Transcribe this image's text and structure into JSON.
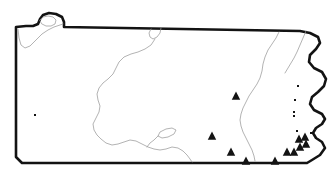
{
  "figure": {
    "kind": "outline-map",
    "width": 335,
    "height": 178,
    "background_color": "#ffffff",
    "outline_color": "#131313",
    "interior_line_color": "#9a9a9a",
    "marker_color": "#131313",
    "title": "",
    "caption": "",
    "labels": []
  },
  "geometry": {
    "state_outline_path": "M 16,27 L 16,157 L 22,163 L 307,163 L 312,160 L 320,155 L 325,148 L 322,142 L 316,138 L 313,133 L 316,128 L 322,124 L 325,119 L 322,114 L 314,110 L 310,104 L 312,97 L 318,92 L 324,86 L 326,79 L 322,72 L 314,68 L 309,62 L 310,55 L 316,49 L 320,43 L 318,37 L 310,33 L 300,31 L 64,27 L 64,22 L 62,17 L 56,14 L 49,13 L 43,15 L 40,19 L 38,24 L 33,26 L 26,26 Z",
    "erie_shoreline_path": "M 18,29 L 19,38 L 21,45 L 25,48 L 30,46 L 36,40 L 42,34 L 48,30 L 54,27 L 60,25 L 63,24",
    "erie_notch_path": "M 40,20 L 43,17 L 48,16 L 53,17 L 56,20 L 55,24 L 51,26 L 46,26 L 42,24 Z",
    "susquehanna_north_path": "M 161,28 L 160,33 L 157,37 L 153,39 L 150,37 L 149,33 L 151,29",
    "susquehanna_main_path": "M 155,39 L 151,45 L 145,49 L 138,52 L 131,54 L 124,57 L 119,62 L 116,68 L 113,74 L 108,79 L 103,83 L 99,88 L 97,94 L 98,100 L 100,106 L 99,112 L 96,118 L 93,124 L 94,130 L 97,135 L 101,139 L 106,143 L 112,145 L 118,144 L 124,142 L 130,140 L 136,141 L 142,144 L 148,147 L 154,149 L 160,150 L 166,149 L 172,147 L 178,148 L 183,151 L 187,155 L 190,159 L 192,162",
    "east_branch_path": "M 279,32 L 276,38 L 272,44 L 268,50 L 265,57 L 263,64 L 262,71 L 260,78 L 257,84 L 253,90 L 249,96 L 246,102 L 243,108 L 241,114 L 240,120 L 241,126 L 243,132 L 246,138 L 249,144 L 252,150 L 254,156 L 255,161",
    "delaware_tributary_path": "M 306,31 L 303,38 L 300,45 L 297,52 L 294,58 L 291,63 L 288,68 L 285,73",
    "lake_path": "M 160,132 L 166,129 L 172,128 L 176,130 L 174,134 L 168,137 L 162,138 L 158,136 Z",
    "lake_outlet_path": "M 158,136 L 154,140 L 150,143 L 147,147"
  },
  "markers": {
    "triangle_size": 4.6,
    "dot_size": 2.0,
    "triangles": [
      {
        "name": "site-central-east",
        "x": 236,
        "y": 96
      },
      {
        "name": "site-central-south",
        "x": 212,
        "y": 136
      },
      {
        "name": "site-south-central",
        "x": 231,
        "y": 152
      },
      {
        "name": "site-south-east",
        "x": 246,
        "y": 161
      },
      {
        "name": "site-southeast-a",
        "x": 275,
        "y": 161
      },
      {
        "name": "site-southeast-b",
        "x": 287,
        "y": 152
      },
      {
        "name": "site-southeast-c",
        "x": 294,
        "y": 152
      },
      {
        "name": "site-southeast-d",
        "x": 300,
        "y": 147
      },
      {
        "name": "site-southeast-e",
        "x": 306,
        "y": 144
      },
      {
        "name": "site-southeast-f",
        "x": 299,
        "y": 139
      },
      {
        "name": "site-southeast-g",
        "x": 305,
        "y": 137
      }
    ],
    "dots": [
      {
        "name": "site-west-isolated",
        "x": 35,
        "y": 115
      },
      {
        "name": "site-east-upper",
        "x": 298,
        "y": 86
      },
      {
        "name": "site-east-mid",
        "x": 295,
        "y": 100
      },
      {
        "name": "site-east-lower-a",
        "x": 294,
        "y": 112
      },
      {
        "name": "site-east-lower-b",
        "x": 294,
        "y": 116
      },
      {
        "name": "site-northeast-edge",
        "x": 297,
        "y": 131
      },
      {
        "name": "site-southeast-dot",
        "x": 311,
        "y": 133
      }
    ]
  }
}
